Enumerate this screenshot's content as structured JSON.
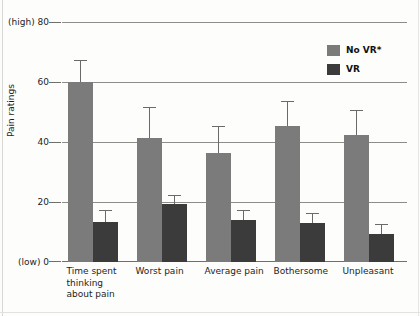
{
  "chart_data": {
    "type": "bar",
    "title": "",
    "xlabel": "",
    "ylabel": "Pain ratings",
    "ylim": [
      0,
      80
    ],
    "yticks": [
      0,
      20,
      40,
      60,
      80
    ],
    "ytick_labels": [
      "(low) 0",
      "20",
      "40",
      "60",
      "(high) 80"
    ],
    "grid": true,
    "legend_position": "top-right",
    "categories": [
      "Time spent thinking about pain",
      "Worst pain",
      "Average pain",
      "Bothersome",
      "Unpleasant"
    ],
    "category_label_lines": [
      [
        "Time spent",
        "thinking",
        "about pain"
      ],
      [
        "Worst pain"
      ],
      [
        "Average pain"
      ],
      [
        "Bothersome"
      ],
      [
        "Unpleasant"
      ]
    ],
    "series": [
      {
        "name": "No VR*",
        "color": "#7b7b7b",
        "values": [
          60,
          41.5,
          36.5,
          45.5,
          42.5
        ],
        "errors_upper": [
          7,
          10,
          8.5,
          8,
          8
        ]
      },
      {
        "name": "VR",
        "color": "#3b3b3b",
        "values": [
          13.5,
          19.5,
          14,
          13,
          9.5
        ],
        "errors_upper": [
          3.5,
          2.5,
          3,
          3,
          3
        ]
      }
    ]
  },
  "legend": {
    "items": [
      {
        "label": "No VR*",
        "color": "#7b7b7b"
      },
      {
        "label": "VR",
        "color": "#3b3b3b"
      }
    ]
  },
  "axis": {
    "y_title": "Pain ratings",
    "y_tick_80": "(high) 80",
    "y_tick_60": "60",
    "y_tick_40": "40",
    "y_tick_20": "20",
    "y_tick_0": "(low) 0"
  },
  "xlabels": {
    "c0_l0": "Time spent",
    "c0_l1": "thinking",
    "c0_l2": "about pain",
    "c1_l0": "Worst pain",
    "c2_l0": "Average pain",
    "c3_l0": "Bothersome",
    "c4_l0": "Unpleasant"
  }
}
